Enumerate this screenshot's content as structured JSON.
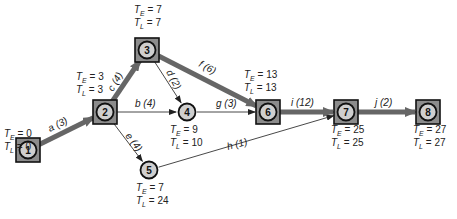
{
  "diagram": {
    "type": "PERT / CPM activity network",
    "nodes": [
      {
        "id": "1",
        "x": 28,
        "y": 150,
        "critical": true,
        "te": "0",
        "tl": "0",
        "label_x": 4,
        "label_y": 137
      },
      {
        "id": "2",
        "x": 105,
        "y": 112,
        "critical": true,
        "te": "3",
        "tl": "3",
        "label_x": 76,
        "label_y": 80
      },
      {
        "id": "3",
        "x": 147,
        "y": 50,
        "critical": true,
        "te": "7",
        "tl": "7",
        "label_x": 134,
        "label_y": 13
      },
      {
        "id": "4",
        "x": 187,
        "y": 112,
        "critical": false,
        "te": "9",
        "tl": "10",
        "label_x": 170,
        "label_y": 133
      },
      {
        "id": "5",
        "x": 149,
        "y": 170,
        "critical": false,
        "te": "7",
        "tl": "24",
        "label_x": 136,
        "label_y": 191
      },
      {
        "id": "6",
        "x": 268,
        "y": 112,
        "critical": true,
        "te": "13",
        "tl": "13",
        "label_x": 244,
        "label_y": 78
      },
      {
        "id": "7",
        "x": 346,
        "y": 112,
        "critical": true,
        "te": "25",
        "tl": "25",
        "label_x": 331,
        "label_y": 133
      },
      {
        "id": "8",
        "x": 428,
        "y": 112,
        "critical": true,
        "te": "27",
        "tl": "27",
        "label_x": 413,
        "label_y": 133
      }
    ],
    "activities": [
      {
        "name": "a",
        "duration": "3",
        "from": "1",
        "to": "2",
        "critical": true,
        "label": "a  (3)",
        "lx": 50,
        "ly": 132,
        "rot": -27
      },
      {
        "name": "b",
        "duration": "4",
        "from": "2",
        "to": "4",
        "critical": false,
        "label": "b  (4)",
        "lx": 135,
        "ly": 107,
        "rot": 0
      },
      {
        "name": "c",
        "duration": "4",
        "from": "2",
        "to": "3",
        "critical": true,
        "label": "c  (4)",
        "lx": 113,
        "ly": 92,
        "rot": -60
      },
      {
        "name": "d",
        "duration": "2",
        "from": "3",
        "to": "4",
        "critical": false,
        "label": "d  (2)",
        "lx": 166,
        "ly": 72,
        "rot": 62
      },
      {
        "name": "e",
        "duration": "4",
        "from": "2",
        "to": "5",
        "critical": false,
        "label": "e  (4)",
        "lx": 125,
        "ly": 136,
        "rot": 52
      },
      {
        "name": "f",
        "duration": "6",
        "from": "3",
        "to": "6",
        "critical": true,
        "label": "f  (6)",
        "lx": 198,
        "ly": 66,
        "rot": 29
      },
      {
        "name": "g",
        "duration": "3",
        "from": "4",
        "to": "6",
        "critical": false,
        "label": "g  (3)",
        "lx": 216,
        "ly": 107,
        "rot": 0
      },
      {
        "name": "h",
        "duration": "1",
        "from": "5",
        "to": "7",
        "critical": false,
        "label": "h  (1)",
        "lx": 228,
        "ly": 150,
        "rot": -15
      },
      {
        "name": "i",
        "duration": "12",
        "from": "6",
        "to": "7",
        "critical": true,
        "label": "i  (12)",
        "lx": 291,
        "ly": 106,
        "rot": 0
      },
      {
        "name": "j",
        "duration": "2",
        "from": "7",
        "to": "8",
        "critical": true,
        "label": "j  (2)",
        "lx": 375,
        "ly": 106,
        "rot": 0
      }
    ],
    "legend_symbols": {
      "earliest_time": "T_E",
      "latest_time": "T_L"
    },
    "colors": {
      "critical_arrow": "#666666",
      "normal_arrow": "#333333",
      "node_fill": "#cfcfcf",
      "critical_box_fill": "#8c8c8c",
      "outline": "#111111",
      "text": "#222222"
    }
  }
}
